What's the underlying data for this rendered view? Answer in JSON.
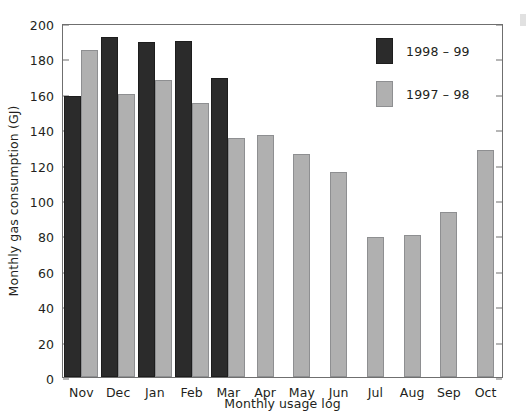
{
  "figure": {
    "background": "#ffffff",
    "dark_color": "#2b2b2b",
    "light_color": "#b0b0b0",
    "axis_color": "#6f6f6f"
  },
  "chart_data": {
    "type": "bar",
    "title": "",
    "xlabel": "Monthly usage log",
    "ylabel": "Monthly gas consumption (GJ)",
    "ylim": [
      0,
      200
    ],
    "ytick_values": [
      0,
      20,
      40,
      60,
      80,
      100,
      120,
      140,
      160,
      180,
      200
    ],
    "ytick_labels": [
      "0",
      "20",
      "40",
      "60",
      "80",
      "100",
      "120",
      "140",
      "160",
      "180",
      "200"
    ],
    "grid": false,
    "legend_position": "upper right",
    "categories": [
      "Nov",
      "Dec",
      "Jan",
      "Feb",
      "Mar",
      "Apr",
      "May",
      "Jun",
      "Jul",
      "Aug",
      "Sep",
      "Oct"
    ],
    "series": [
      {
        "name": "1998 – 99",
        "color": "#2b2b2b",
        "values": [
          159,
          192,
          189,
          190,
          169,
          null,
          null,
          null,
          null,
          null,
          null,
          null
        ]
      },
      {
        "name": "1997 – 98",
        "color": "#b0b0b0",
        "values": [
          185,
          160,
          168,
          155,
          135,
          137,
          126,
          116,
          79,
          80,
          93,
          128
        ]
      }
    ]
  },
  "legend": {
    "entries": [
      {
        "label": "1998 – 99",
        "swatch": "dark"
      },
      {
        "label": "1997 – 98",
        "swatch": "light"
      }
    ]
  }
}
